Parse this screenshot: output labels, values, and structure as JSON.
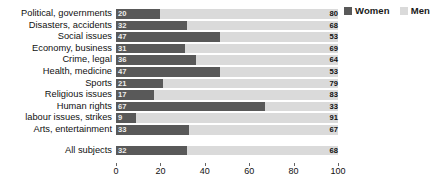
{
  "legend": {
    "position": "top-right",
    "entries": [
      {
        "label": "Women",
        "color": "#595959"
      },
      {
        "label": "Men",
        "color": "#dadada"
      }
    ]
  },
  "chart_data": {
    "type": "bar",
    "orientation": "horizontal",
    "stacked": true,
    "title": "",
    "subtitle": "",
    "xlabel": "",
    "ylabel": "",
    "xlim": [
      0,
      100
    ],
    "grid": false,
    "xticks": [
      0,
      20,
      40,
      60,
      80,
      100
    ],
    "categories": [
      "Political, governments",
      "Disasters, accidents",
      "Social issues",
      "Economy, business",
      "Crime, legal",
      "Health, medicine",
      "Sports",
      "Religious issues",
      "Human rights",
      "labour issues, strikes",
      "Arts, entertainment",
      "All subjects"
    ],
    "series": [
      {
        "name": "Women",
        "color": "#595959",
        "values": [
          20,
          32,
          47,
          31,
          36,
          47,
          21,
          17,
          67,
          9,
          33,
          32
        ]
      },
      {
        "name": "Men",
        "color": "#dadada",
        "values": [
          80,
          68,
          53,
          69,
          64,
          53,
          79,
          83,
          33,
          91,
          67,
          68
        ]
      }
    ],
    "summary_row_index": 11
  }
}
